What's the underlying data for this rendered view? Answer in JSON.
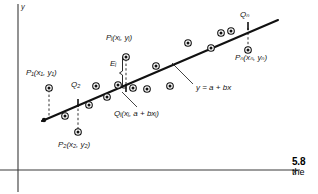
{
  "figure": {
    "axes": {
      "x_label": "x",
      "y_label": "y",
      "x_axis_y": 170,
      "y_axis_x": 18,
      "grid": false
    },
    "line": {
      "equation_label": "y = a + bx",
      "x1": 42,
      "y1": 121,
      "x2": 278,
      "y2": 20,
      "color": "#111111"
    },
    "annotations": [
      {
        "name": "point-label-p1",
        "text": "P₁(x₁, y₁)",
        "x": 26,
        "y": 73
      },
      {
        "name": "point-label-q2",
        "text": "Q₂",
        "x": 71,
        "y": 85
      },
      {
        "name": "point-label-p2",
        "text": "P₂(x₂, y₂)",
        "x": 58,
        "y": 145
      },
      {
        "name": "point-label-pi",
        "text": "Pᵢ(xᵢ, yᵢ)",
        "x": 108,
        "y": 38
      },
      {
        "name": "residual-label-ei",
        "text": "Eᵢ",
        "x": 111,
        "y": 62
      },
      {
        "name": "point-label-qi",
        "text": "Qᵢ(xᵢ, a + bxᵢ)",
        "x": 116,
        "y": 113
      },
      {
        "name": "line-equation-label",
        "text": "y = a + bx",
        "x": 196,
        "y": 87
      },
      {
        "name": "point-label-qn",
        "text": "Qₙ",
        "x": 240,
        "y": 15
      },
      {
        "name": "point-label-pn",
        "text": "Pₙ(xₙ, yₙ)",
        "x": 237,
        "y": 57
      }
    ],
    "scatter_points": [
      {
        "x": 49,
        "y": 88
      },
      {
        "x": 65,
        "y": 116
      },
      {
        "x": 78,
        "y": 132
      },
      {
        "x": 88,
        "y": 105
      },
      {
        "x": 96,
        "y": 86
      },
      {
        "x": 89,
        "y": 98
      },
      {
        "x": 107,
        "y": 98
      },
      {
        "x": 118,
        "y": 84
      },
      {
        "x": 126,
        "y": 57
      },
      {
        "x": 131,
        "y": 88
      },
      {
        "x": 146,
        "y": 88
      },
      {
        "x": 156,
        "y": 66
      },
      {
        "x": 169,
        "y": 86
      },
      {
        "x": 188,
        "y": 43
      },
      {
        "x": 211,
        "y": 48
      },
      {
        "x": 221,
        "y": 33
      },
      {
        "x": 231,
        "y": 31
      },
      {
        "x": 248,
        "y": 50
      }
    ],
    "vertical_drops": [
      {
        "name": "drop-p1",
        "x": 49,
        "y_top": 88,
        "y_bottom": 118
      },
      {
        "name": "drop-p2",
        "x": 78,
        "y_top": 103,
        "y_bottom": 132
      },
      {
        "name": "drop-pi",
        "x": 126,
        "y_top": 57,
        "y_bottom": 88
      },
      {
        "name": "drop-pn",
        "x": 248,
        "y_top": 26,
        "y_bottom": 50
      }
    ],
    "tick_marks": [
      {
        "name": "tick-q2",
        "x": 78,
        "y": 103
      },
      {
        "name": "tick-qi",
        "x": 126,
        "y": 88
      },
      {
        "name": "tick-qn",
        "x": 248,
        "y": 26
      }
    ],
    "leader_lines": [
      {
        "name": "leader-qi",
        "x1": 122,
        "y1": 92,
        "x2": 137,
        "y2": 107
      },
      {
        "name": "leader-equation",
        "x1": 172,
        "y1": 63,
        "x2": 193,
        "y2": 84
      }
    ]
  },
  "page_marker": {
    "number": "5.8",
    "word": "the"
  }
}
